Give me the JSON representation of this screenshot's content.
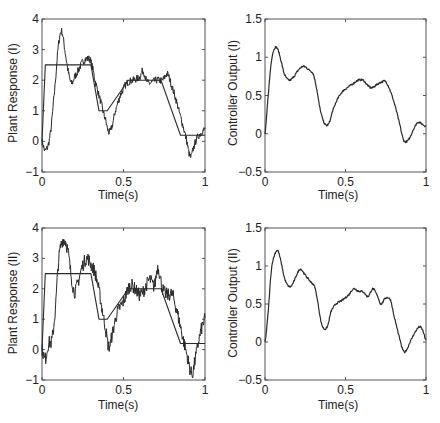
{
  "figure": {
    "panels": [
      {
        "id": "p1",
        "ylabel": "Plant Response (I)",
        "xlabel": "Time(s)"
      },
      {
        "id": "p2",
        "ylabel": "Controller Output (I)",
        "xlabel": "Time(s)"
      },
      {
        "id": "p3",
        "ylabel": "Plant Response (II)",
        "xlabel": "Time(s)"
      },
      {
        "id": "p4",
        "ylabel": "Controller Output (II)",
        "xlabel": "Time(s)"
      }
    ]
  },
  "chart_data": [
    {
      "type": "line",
      "title": "",
      "xlabel": "Time(s)",
      "ylabel": "Plant Response (I)",
      "xlim": [
        0,
        1
      ],
      "ylim": [
        -1,
        4
      ],
      "xticks": [
        0,
        0.5,
        1
      ],
      "xtick_labels": [
        "0",
        "0.5",
        "1"
      ],
      "yticks": [
        -1,
        0,
        1,
        2,
        3,
        4
      ],
      "ytick_labels": [
        "-1",
        "0",
        "1",
        "2",
        "3",
        "4"
      ],
      "grid": false,
      "series": [
        {
          "name": "reference",
          "style": "step-ramp",
          "x": [
            0,
            0.02,
            0.3,
            0.35,
            0.4,
            0.53,
            0.73,
            0.85,
            1.0
          ],
          "y": [
            0,
            2.5,
            2.5,
            1.0,
            1.0,
            2.0,
            2.0,
            0.2,
            0.2
          ]
        },
        {
          "name": "response",
          "style": "noisy",
          "x": [
            0,
            0.02,
            0.05,
            0.08,
            0.1,
            0.12,
            0.14,
            0.16,
            0.18,
            0.2,
            0.22,
            0.25,
            0.28,
            0.3,
            0.33,
            0.36,
            0.39,
            0.41,
            0.43,
            0.45,
            0.48,
            0.52,
            0.56,
            0.6,
            0.62,
            0.64,
            0.66,
            0.7,
            0.74,
            0.77,
            0.79,
            0.82,
            0.85,
            0.88,
            0.91,
            0.93,
            0.95,
            0.98,
            1.0
          ],
          "y": [
            0,
            -0.3,
            0.2,
            1.8,
            3.1,
            3.6,
            3.0,
            2.3,
            1.9,
            2.1,
            2.3,
            2.6,
            2.7,
            2.6,
            1.9,
            1.3,
            0.7,
            0.3,
            0.5,
            1.0,
            1.5,
            1.9,
            2.0,
            2.1,
            2.3,
            2.0,
            1.9,
            2.0,
            2.0,
            2.2,
            1.9,
            1.4,
            0.8,
            0.2,
            -0.5,
            -0.2,
            0.1,
            0.3,
            0.4
          ]
        }
      ]
    },
    {
      "type": "line",
      "title": "",
      "xlabel": "Time(s)",
      "ylabel": "Controller Output (I)",
      "xlim": [
        0,
        1
      ],
      "ylim": [
        -0.5,
        1.5
      ],
      "xticks": [
        0,
        0.5,
        1
      ],
      "xtick_labels": [
        "0",
        "0.5",
        "1"
      ],
      "yticks": [
        -0.5,
        0,
        0.5,
        1,
        1.5
      ],
      "ytick_labels": [
        "-0.5",
        "0",
        "0.5",
        "1",
        "1.5"
      ],
      "grid": false,
      "series": [
        {
          "name": "controller",
          "style": "smooth",
          "x": [
            0,
            0.02,
            0.04,
            0.06,
            0.08,
            0.1,
            0.12,
            0.15,
            0.18,
            0.21,
            0.24,
            0.27,
            0.3,
            0.32,
            0.34,
            0.36,
            0.38,
            0.4,
            0.42,
            0.45,
            0.48,
            0.51,
            0.55,
            0.58,
            0.61,
            0.63,
            0.66,
            0.7,
            0.73,
            0.75,
            0.78,
            0.81,
            0.84,
            0.86,
            0.88,
            0.9,
            0.92,
            0.95,
            0.98,
            1.0
          ],
          "y": [
            0,
            0.5,
            0.95,
            1.12,
            1.1,
            0.95,
            0.78,
            0.7,
            0.75,
            0.84,
            0.88,
            0.84,
            0.78,
            0.6,
            0.35,
            0.18,
            0.11,
            0.15,
            0.3,
            0.45,
            0.55,
            0.6,
            0.66,
            0.7,
            0.7,
            0.65,
            0.6,
            0.65,
            0.68,
            0.68,
            0.55,
            0.35,
            0.1,
            -0.08,
            -0.1,
            -0.05,
            0.05,
            0.15,
            0.12,
            0.1
          ]
        }
      ]
    },
    {
      "type": "line",
      "title": "",
      "xlabel": "Time(s)",
      "ylabel": "Plant Response (II)",
      "xlim": [
        0,
        1
      ],
      "ylim": [
        -1,
        4
      ],
      "xticks": [
        0,
        0.5,
        1
      ],
      "xtick_labels": [
        "0",
        "0.5",
        "1"
      ],
      "yticks": [
        -1,
        0,
        1,
        2,
        3,
        4
      ],
      "ytick_labels": [
        "-1",
        "0",
        "1",
        "2",
        "3",
        "4"
      ],
      "grid": false,
      "series": [
        {
          "name": "reference",
          "style": "step-ramp",
          "x": [
            0,
            0.02,
            0.3,
            0.35,
            0.4,
            0.53,
            0.73,
            0.85,
            1.0
          ],
          "y": [
            0,
            2.5,
            2.5,
            1.0,
            1.0,
            2.0,
            2.0,
            0.2,
            0.2
          ]
        },
        {
          "name": "response",
          "style": "noisy",
          "x": [
            0,
            0.02,
            0.04,
            0.06,
            0.08,
            0.1,
            0.12,
            0.14,
            0.16,
            0.18,
            0.2,
            0.22,
            0.24,
            0.26,
            0.28,
            0.3,
            0.32,
            0.34,
            0.36,
            0.39,
            0.41,
            0.43,
            0.46,
            0.5,
            0.54,
            0.57,
            0.6,
            0.63,
            0.66,
            0.69,
            0.71,
            0.74,
            0.77,
            0.8,
            0.83,
            0.86,
            0.89,
            0.92,
            0.94,
            0.97,
            1.0
          ],
          "y": [
            0,
            -0.3,
            0.2,
            0.3,
            1.2,
            2.8,
            3.5,
            3.6,
            3.2,
            2.4,
            1.9,
            2.2,
            2.6,
            2.9,
            3.0,
            2.8,
            2.6,
            2.2,
            1.6,
            0.7,
            0.1,
            0.5,
            1.2,
            1.6,
            2.1,
            2.0,
            1.8,
            2.0,
            2.3,
            2.1,
            2.7,
            2.0,
            1.8,
            1.8,
            1.2,
            0.5,
            -0.2,
            -0.8,
            -0.3,
            0.5,
            1.0
          ]
        }
      ]
    },
    {
      "type": "line",
      "title": "",
      "xlabel": "Time(s)",
      "ylabel": "Controller Output (II)",
      "xlim": [
        0,
        1
      ],
      "ylim": [
        -0.5,
        1.5
      ],
      "xticks": [
        0,
        0.5,
        1
      ],
      "xtick_labels": [
        "0",
        "0.5",
        "1"
      ],
      "yticks": [
        -0.5,
        0,
        0.5,
        1,
        1.5
      ],
      "ytick_labels": [
        "-0.5",
        "0",
        "0.5",
        "1",
        "1.5"
      ],
      "grid": false,
      "series": [
        {
          "name": "controller",
          "style": "smooth",
          "x": [
            0,
            0.02,
            0.04,
            0.06,
            0.08,
            0.1,
            0.12,
            0.14,
            0.16,
            0.18,
            0.2,
            0.22,
            0.25,
            0.28,
            0.31,
            0.33,
            0.35,
            0.37,
            0.39,
            0.41,
            0.44,
            0.48,
            0.52,
            0.55,
            0.58,
            0.61,
            0.64,
            0.67,
            0.7,
            0.72,
            0.75,
            0.78,
            0.8,
            0.83,
            0.86,
            0.88,
            0.9,
            0.93,
            0.96,
            0.98,
            1.0
          ],
          "y": [
            0,
            0.4,
            0.95,
            1.15,
            1.2,
            1.05,
            0.85,
            0.75,
            0.73,
            0.8,
            0.9,
            0.96,
            0.88,
            0.8,
            0.72,
            0.5,
            0.25,
            0.17,
            0.22,
            0.4,
            0.5,
            0.55,
            0.62,
            0.7,
            0.67,
            0.66,
            0.6,
            0.7,
            0.6,
            0.5,
            0.58,
            0.55,
            0.35,
            0.1,
            -0.12,
            -0.1,
            0.0,
            0.12,
            0.2,
            0.15,
            0.02
          ]
        }
      ]
    }
  ]
}
